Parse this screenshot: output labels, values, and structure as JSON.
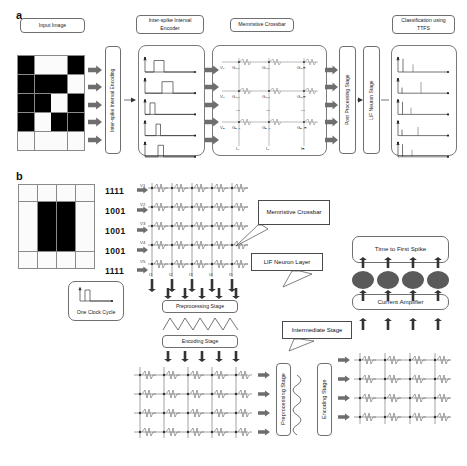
{
  "figure": {
    "panels": [
      {
        "id": "a",
        "label": "a"
      },
      {
        "id": "b",
        "label": "b"
      }
    ]
  },
  "panel_a": {
    "label": "a",
    "stages": {
      "input_image": "Input Image",
      "encoder": "Inter-spike Interval Encoder",
      "crossbar": "Memristive Crossbar",
      "classification": "Classification using TTFS",
      "encoding_vertical": "Inter-spike Interval Encoding",
      "post_processing_vertical": "Post Processing Stage",
      "lif_vertical": "LIF Neuron Stage"
    },
    "input_grid": {
      "rows": 5,
      "cols": 4,
      "cells": [
        [
          1,
          0,
          0,
          1
        ],
        [
          1,
          1,
          1,
          0
        ],
        [
          1,
          1,
          0,
          1
        ],
        [
          1,
          0,
          1,
          1
        ],
        [
          0,
          0,
          0,
          0
        ]
      ]
    },
    "crossbar_labels": {
      "voltages": [
        "V₁",
        "V₂",
        "Vₙ"
      ],
      "conductances": [
        [
          "G₁,₁",
          "G₁,₂",
          "G₁,ₘ"
        ],
        [
          "G₂,₁",
          "G₂,₂",
          "G₂,ₘ"
        ],
        [
          "Gₙ,₁",
          "Gₙ,₂",
          "Gₙ,ₘ"
        ]
      ],
      "currents": [
        "I₁",
        "I₂",
        "Iₘ"
      ],
      "ellipsis": "⋯"
    },
    "encoder_waveforms": [
      {
        "delay": 0.18,
        "width": 0.2
      },
      {
        "delay": 0.34,
        "width": 0.22
      },
      {
        "delay": 0.1,
        "width": 0.1
      },
      {
        "delay": 0.22,
        "width": 0.09
      },
      {
        "delay": 0.26,
        "width": 0.11
      }
    ],
    "ttfs_spikes": [
      {
        "t1": 0.1,
        "h1": 0.95,
        "t2": 0.3,
        "h2": 0.55
      },
      {
        "t1": 0.08,
        "h1": 0.4,
        "t2": 0.46,
        "h2": 0.8
      },
      {
        "t1": 0.09,
        "h1": 0.9,
        "t2": 0.26,
        "h2": 0.48
      },
      {
        "t1": 0.08,
        "h1": 0.42,
        "t2": 0.4,
        "h2": 0.62
      },
      {
        "t1": 0.09,
        "h1": 0.9,
        "t2": 0.28,
        "h2": 0.5
      }
    ]
  },
  "panel_b": {
    "label": "b",
    "input_grid": {
      "rows": 5,
      "cols": 4,
      "cells": [
        [
          0,
          0,
          0,
          0
        ],
        [
          0,
          1,
          1,
          0
        ],
        [
          0,
          1,
          1,
          0
        ],
        [
          0,
          1,
          1,
          0
        ],
        [
          0,
          0,
          0,
          0
        ]
      ]
    },
    "bit_rows": [
      "1111",
      "1001",
      "1001",
      "1001",
      "1111"
    ],
    "callouts": {
      "memristive_crossbar": "Memristive Crossbar",
      "lif_neuron_layer": "LIF Neuron Layer",
      "intermediate_stage": "Intermediate Stage"
    },
    "boxes": {
      "one_clock_cycle": "One Clock Cycle",
      "preprocessing_stage": "Preprocessing Stage",
      "encoding_stage": "Encoding Stage",
      "time_to_first_spike": "Time to First Spike",
      "current_amplifier": "Current Amplifier",
      "preprocessing_stage_2": "Preprocessing Stage",
      "encoding_stage_2": "Encoding Stage"
    },
    "crossbar_top": {
      "row_inputs": [
        "V1",
        "V2",
        "V3",
        "V4",
        "V5"
      ],
      "col_outputs": [
        "I1",
        "I2",
        "I3",
        "I4",
        "I5"
      ],
      "rows": 5,
      "cols": 5
    },
    "crossbar_bottom_left": {
      "rows": 4,
      "cols": 5
    },
    "crossbar_bottom_right": {
      "rows": 4,
      "cols": 4
    },
    "neuron_count": 4,
    "neuron_color": "#5a5a5a"
  }
}
